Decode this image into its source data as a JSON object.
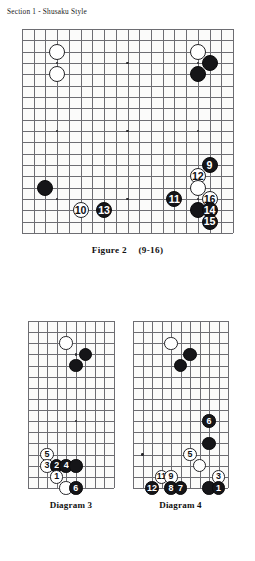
{
  "header": {
    "section_title": "Section 1 - Shusaku Style"
  },
  "captions": {
    "figure2_label": "Figure 2",
    "figure2_moves": "(9-16)",
    "diagram3_label": "Diagram 3",
    "diagram4_label": "Diagram 4"
  },
  "colors": {
    "black_stone": "#151518",
    "white_stone": "#ffffff",
    "grid_line": "#6d6d72",
    "board_border": "#3b3b40",
    "board_bg": "#fbfbfa",
    "text": "#111111"
  },
  "boards": {
    "figure2": {
      "name": "Figure 2",
      "cols": 19,
      "rows": 19,
      "x": 22,
      "y": 29,
      "width": 211,
      "height": 204,
      "hoshi": [
        {
          "col": 3,
          "row": 3
        },
        {
          "col": 9,
          "row": 3
        },
        {
          "col": 15,
          "row": 3
        },
        {
          "col": 3,
          "row": 9
        },
        {
          "col": 9,
          "row": 9
        },
        {
          "col": 15,
          "row": 9
        },
        {
          "col": 3,
          "row": 15
        },
        {
          "col": 9,
          "row": 15
        },
        {
          "col": 15,
          "row": 15
        }
      ],
      "stones": [
        {
          "col": 3,
          "row": 2,
          "color": "white",
          "label": ""
        },
        {
          "col": 3,
          "row": 4,
          "color": "white",
          "label": ""
        },
        {
          "col": 15,
          "row": 2,
          "color": "white",
          "label": ""
        },
        {
          "col": 16,
          "row": 3,
          "color": "black",
          "label": ""
        },
        {
          "col": 15,
          "row": 4,
          "color": "black",
          "label": ""
        },
        {
          "col": 16,
          "row": 12,
          "color": "black",
          "label": "9"
        },
        {
          "col": 15,
          "row": 13,
          "color": "white",
          "label": "12"
        },
        {
          "col": 15,
          "row": 14,
          "color": "white",
          "label": ""
        },
        {
          "col": 13,
          "row": 15,
          "color": "black",
          "label": "11"
        },
        {
          "col": 16,
          "row": 15,
          "color": "white",
          "label": "16"
        },
        {
          "col": 15,
          "row": 16,
          "color": "black",
          "label": ""
        },
        {
          "col": 16,
          "row": 16,
          "color": "black",
          "label": "14"
        },
        {
          "col": 16,
          "row": 17,
          "color": "black",
          "label": "15"
        },
        {
          "col": 2,
          "row": 14,
          "color": "black",
          "label": ""
        },
        {
          "col": 5,
          "row": 16,
          "color": "white",
          "label": "10"
        },
        {
          "col": 7,
          "row": 16,
          "color": "black",
          "label": "13"
        }
      ]
    },
    "diagram3": {
      "name": "Diagram 3",
      "cols": 10,
      "rows": 16,
      "x": 28,
      "y": 321,
      "width": 86,
      "height": 167,
      "hoshi": [
        {
          "col": 5,
          "row": 3
        },
        {
          "col": 5,
          "row": 9
        }
      ],
      "stones": [
        {
          "col": 4,
          "row": 2,
          "color": "white",
          "label": ""
        },
        {
          "col": 6,
          "row": 3,
          "color": "black",
          "label": ""
        },
        {
          "col": 5,
          "row": 4,
          "color": "black",
          "label": ""
        },
        {
          "col": 2,
          "row": 12,
          "color": "white",
          "label": "5"
        },
        {
          "col": 2,
          "row": 13,
          "color": "white",
          "label": "3"
        },
        {
          "col": 3,
          "row": 13,
          "color": "black",
          "label": "2"
        },
        {
          "col": 4,
          "row": 13,
          "color": "black",
          "label": "4"
        },
        {
          "col": 5,
          "row": 13,
          "color": "black",
          "label": ""
        },
        {
          "col": 3,
          "row": 14,
          "color": "white",
          "label": "1"
        },
        {
          "col": 4,
          "row": 15,
          "color": "white",
          "label": ""
        },
        {
          "col": 5,
          "row": 15,
          "color": "black",
          "label": "6"
        }
      ]
    },
    "diagram4": {
      "name": "Diagram 4",
      "cols": 11,
      "rows": 16,
      "x": 133,
      "y": 321,
      "width": 95,
      "height": 167,
      "hoshi": [
        {
          "col": 6,
          "row": 3
        },
        {
          "col": 6,
          "row": 12
        },
        {
          "col": 1,
          "row": 12
        }
      ],
      "stones": [
        {
          "col": 4,
          "row": 2,
          "color": "white",
          "label": ""
        },
        {
          "col": 6,
          "row": 3,
          "color": "black",
          "label": ""
        },
        {
          "col": 5,
          "row": 4,
          "color": "black",
          "label": ""
        },
        {
          "col": 8,
          "row": 9,
          "color": "black",
          "label": "6"
        },
        {
          "col": 8,
          "row": 11,
          "color": "black",
          "label": ""
        },
        {
          "col": 6,
          "row": 12,
          "color": "white",
          "label": "5"
        },
        {
          "col": 7,
          "row": 13,
          "color": "white",
          "label": ""
        },
        {
          "col": 3,
          "row": 14,
          "color": "white",
          "label": "11"
        },
        {
          "col": 4,
          "row": 14,
          "color": "white",
          "label": "9"
        },
        {
          "col": 9,
          "row": 14,
          "color": "white",
          "label": "3"
        },
        {
          "col": 2,
          "row": 15,
          "color": "black",
          "label": "12"
        },
        {
          "col": 4,
          "row": 15,
          "color": "black",
          "label": "8"
        },
        {
          "col": 5,
          "row": 15,
          "color": "black",
          "label": "7"
        },
        {
          "col": 8,
          "row": 15,
          "color": "black",
          "label": ""
        },
        {
          "col": 9,
          "row": 15,
          "color": "black",
          "label": "1"
        }
      ]
    }
  }
}
